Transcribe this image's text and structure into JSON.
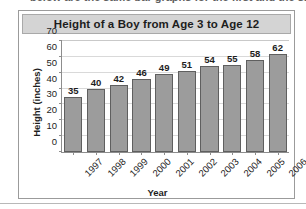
{
  "clipped_top_text": "below are the same bar graphs for the first and the same",
  "colors": {
    "panel_border": "#9b9b9b",
    "title_band_background": "#d4d4d4",
    "bar_fill": "#9c9c9c",
    "bar_outline": "#5f5f5f",
    "gridline": "#d9d9d9",
    "axis_line": "#8d8d8d",
    "text": "#1d1d1d",
    "plot_background": "#ffffff"
  },
  "chart_data": {
    "type": "bar",
    "title": "Height of a Boy from Age 3 to Age 12",
    "xlabel": "Year",
    "ylabel": "Height (inches)",
    "categories": [
      "1997",
      "1998",
      "1999",
      "2000",
      "2001",
      "2002",
      "2003",
      "2004",
      "2005",
      "2006"
    ],
    "values": [
      35,
      40,
      42,
      46,
      49,
      51,
      54,
      55,
      58,
      62
    ],
    "value_labels": [
      "35",
      "40",
      "42",
      "46",
      "49",
      "51",
      "54",
      "55",
      "58",
      "62"
    ],
    "ylim": [
      0,
      70
    ],
    "ytick_step": 10,
    "ytick_labels": [
      "70",
      "60",
      "50",
      "40",
      "30",
      "20",
      "10",
      "0"
    ],
    "ytick_values": [
      70,
      60,
      50,
      40,
      30,
      20,
      10,
      0
    ],
    "grid": true,
    "grid_axis": "y",
    "legend": false,
    "legend_position": "none",
    "xtick_label_rotation": -45
  }
}
